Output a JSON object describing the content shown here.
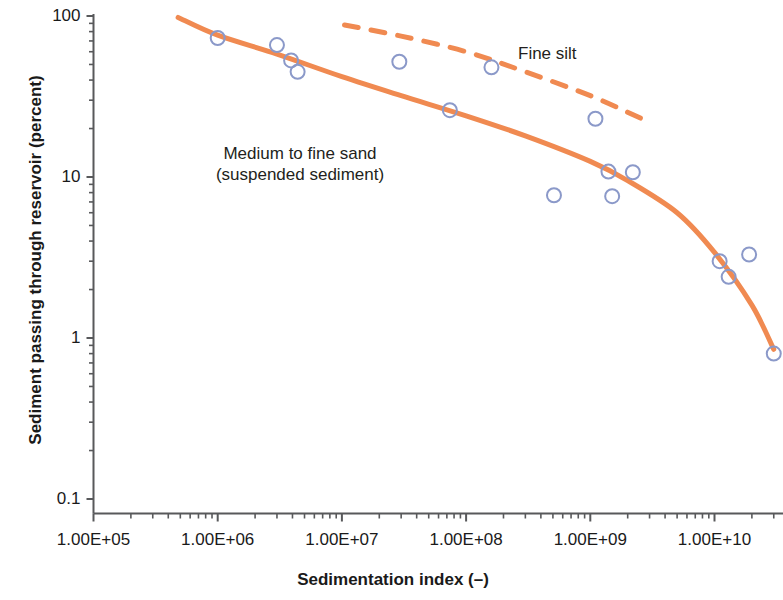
{
  "chart_data": {
    "type": "scatter",
    "title": "",
    "xlabel": "Sedimentation index (–)",
    "ylabel": "Sediment passing through reservoir (percent)",
    "xscale": "log",
    "yscale": "log",
    "xlim": [
      100000,
      30000000000
    ],
    "ylim": [
      0.1,
      100
    ],
    "grid": false,
    "legend_position": "inline-annotations",
    "xtick_labels": [
      "1.00E+05",
      "1.00E+06",
      "1.00E+07",
      "1.00E+08",
      "1.00E+09",
      "1.00E+10"
    ],
    "xtick_values": [
      100000,
      1000000,
      10000000,
      100000000,
      1000000000,
      10000000000
    ],
    "ytick_labels": [
      "100",
      "10",
      "1",
      "0.1"
    ],
    "ytick_values": [
      100,
      10,
      1,
      0.1
    ],
    "annotations": [
      {
        "name": "medium-to-fine-sand",
        "line1": "Medium to fine sand",
        "line2": "(suspended sediment)"
      },
      {
        "name": "fine-silt",
        "text": "Fine silt"
      }
    ],
    "series": [
      {
        "name": "Medium to fine sand (suspended sediment)",
        "type": "line",
        "style": "solid",
        "color": "#F08A51",
        "points": [
          {
            "x": 480000,
            "y": 98
          },
          {
            "x": 1000000,
            "y": 76
          },
          {
            "x": 3000000,
            "y": 58
          },
          {
            "x": 10000000,
            "y": 42
          },
          {
            "x": 30000000,
            "y": 32
          },
          {
            "x": 100000000,
            "y": 24
          },
          {
            "x": 300000000,
            "y": 18
          },
          {
            "x": 1000000000,
            "y": 12.5
          },
          {
            "x": 2000000000,
            "y": 9.5
          },
          {
            "x": 5000000000,
            "y": 6.0
          },
          {
            "x": 10000000000,
            "y": 3.4
          },
          {
            "x": 20000000000,
            "y": 1.6
          },
          {
            "x": 30000000000,
            "y": 0.85
          }
        ]
      },
      {
        "name": "Fine silt",
        "type": "line",
        "style": "dashed",
        "color": "#F08A51",
        "points": [
          {
            "x": 10500000,
            "y": 88
          },
          {
            "x": 30000000,
            "y": 75
          },
          {
            "x": 100000000,
            "y": 60
          },
          {
            "x": 300000000,
            "y": 45
          },
          {
            "x": 1000000000,
            "y": 32
          },
          {
            "x": 2600000000,
            "y": 23
          }
        ]
      },
      {
        "name": "Observed data",
        "type": "scatter",
        "marker": "open-circle",
        "color": "#8B99C9",
        "points": [
          {
            "x": 1000000,
            "y": 73
          },
          {
            "x": 3000000,
            "y": 66
          },
          {
            "x": 3900000,
            "y": 53
          },
          {
            "x": 4400000,
            "y": 45
          },
          {
            "x": 29000000,
            "y": 52
          },
          {
            "x": 74000000,
            "y": 26
          },
          {
            "x": 160000000,
            "y": 48
          },
          {
            "x": 510000000,
            "y": 7.7
          },
          {
            "x": 1100000000,
            "y": 23
          },
          {
            "x": 1400000000,
            "y": 10.8
          },
          {
            "x": 1500000000,
            "y": 7.6
          },
          {
            "x": 2200000000,
            "y": 10.7
          },
          {
            "x": 11000000000,
            "y": 3.0
          },
          {
            "x": 13000000000,
            "y": 2.4
          },
          {
            "x": 19000000000,
            "y": 3.3
          },
          {
            "x": 30000000000,
            "y": 0.8
          }
        ]
      }
    ]
  },
  "axes": {
    "y_title": "Sediment passing through reservoir (percent)",
    "x_title": "Sedimentation index (–)"
  },
  "colors": {
    "curve": "#F08A51",
    "marker_stroke": "#8B99C9",
    "axis": "#58595B",
    "text": "#231f20"
  }
}
